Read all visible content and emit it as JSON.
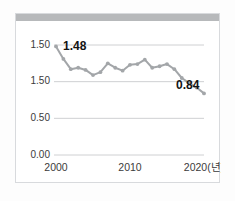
{
  "chart_data": {
    "type": "line",
    "title": "",
    "subtitle": "",
    "xlabel": "",
    "ylabel": "",
    "x": [
      2000,
      2001,
      2002,
      2003,
      2004,
      2005,
      2006,
      2007,
      2008,
      2009,
      2010,
      2011,
      2012,
      2013,
      2014,
      2015,
      2016,
      2017,
      2018,
      2019,
      2020
    ],
    "values": [
      1.48,
      1.31,
      1.17,
      1.19,
      1.16,
      1.09,
      1.13,
      1.25,
      1.19,
      1.15,
      1.23,
      1.24,
      1.3,
      1.19,
      1.21,
      1.24,
      1.17,
      1.05,
      0.98,
      0.92,
      0.84
    ],
    "series": [
      {
        "name": "fertility-rate",
        "values": [
          1.48,
          1.31,
          1.17,
          1.19,
          1.16,
          1.09,
          1.13,
          1.25,
          1.19,
          1.15,
          1.23,
          1.24,
          1.3,
          1.19,
          1.21,
          1.24,
          1.17,
          1.05,
          0.98,
          0.92,
          0.84
        ]
      }
    ],
    "xlim": [
      2000,
      2020
    ],
    "ylim": [
      0.0,
      1.5
    ],
    "grid": true,
    "grid_axis": "y",
    "legend": false,
    "legend_position": "none",
    "y_ticks": [
      {
        "value": 1.5,
        "label": "1.50"
      },
      {
        "value": 1.0,
        "label": "1.50"
      },
      {
        "value": 0.5,
        "label": "0.50"
      },
      {
        "value": 0.0,
        "label": "0.00"
      }
    ],
    "x_ticks": [
      {
        "value": 2000,
        "label": "2000"
      },
      {
        "value": 2010,
        "label": "2010"
      },
      {
        "value": 2020,
        "label": "2020(년)"
      }
    ],
    "annotations": [
      {
        "name": "first-value-label",
        "text": "1.48",
        "x": 2000,
        "y": 1.48
      },
      {
        "name": "last-value-label",
        "text": "0.84",
        "x": 2020,
        "y": 0.84
      }
    ],
    "colors": {
      "line": "#a3a6a9",
      "marker": "#a3a6a9",
      "grid": "#c9cbcd",
      "tick_text": "#3b3b3b",
      "annotation_text": "#131313",
      "header_band": "#b7b9bb",
      "card_background": "#ffffff",
      "card_border": "#d8dadd",
      "page_background": "#fdfdfd"
    }
  }
}
